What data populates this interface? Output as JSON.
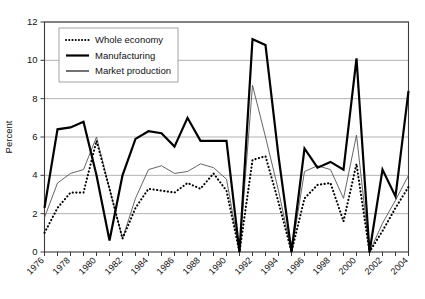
{
  "chart_data": {
    "type": "line",
    "title": "",
    "xlabel": "",
    "ylabel": "Percent",
    "ylim": [
      0,
      12
    ],
    "ytick_labels": [
      "0",
      "2",
      "4",
      "6",
      "8",
      "10",
      "12"
    ],
    "yticks": [
      0,
      2,
      4,
      6,
      8,
      10,
      12
    ],
    "grid": "horizontal",
    "legend_position": "top-left",
    "x": [
      1976,
      1977,
      1978,
      1979,
      1980,
      1981,
      1982,
      1983,
      1984,
      1985,
      1986,
      1987,
      1988,
      1989,
      1990,
      1991,
      1992,
      1993,
      1994,
      1995,
      1996,
      1997,
      1998,
      1999,
      2000,
      2001,
      2002,
      2003,
      2004
    ],
    "xtick_labels": [
      "1976",
      "1978",
      "1980",
      "1982",
      "1984",
      "1986",
      "1988",
      "1990",
      "1992",
      "1994",
      "1996",
      "1998",
      "2000",
      "2002",
      "2004"
    ],
    "xticks": [
      1976,
      1978,
      1980,
      1982,
      1984,
      1986,
      1988,
      1990,
      1992,
      1994,
      1996,
      1998,
      2000,
      2002,
      2004
    ],
    "series": [
      {
        "name": "Whole economy",
        "style": "dotted",
        "color": "#000000",
        "values": [
          1.0,
          2.3,
          3.1,
          3.1,
          5.8,
          3.3,
          0.7,
          2.3,
          3.3,
          3.2,
          3.1,
          3.6,
          3.3,
          4.1,
          3.2,
          0.0,
          4.8,
          5.0,
          2.6,
          0.0,
          2.8,
          3.5,
          3.6,
          1.6,
          4.6,
          0.0,
          1.1,
          2.3,
          3.4
        ]
      },
      {
        "name": "Manufacturing",
        "style": "solid-thick",
        "color": "#000000",
        "values": [
          2.3,
          6.4,
          6.5,
          6.8,
          4.0,
          0.6,
          4.0,
          5.9,
          6.3,
          6.2,
          5.5,
          7.0,
          5.8,
          5.8,
          5.8,
          0.0,
          11.1,
          10.8,
          5.0,
          0.0,
          5.4,
          4.4,
          4.7,
          4.3,
          10.1,
          0.0,
          4.3,
          2.9,
          8.4
        ]
      },
      {
        "name": "Market production",
        "style": "solid-thin",
        "color": "#555555",
        "values": [
          1.8,
          3.6,
          4.1,
          4.3,
          6.0,
          3.3,
          0.7,
          2.8,
          4.3,
          4.5,
          4.1,
          4.2,
          4.6,
          4.4,
          3.8,
          0.0,
          8.7,
          6.0,
          3.2,
          0.0,
          4.2,
          4.5,
          4.3,
          2.8,
          6.1,
          0.0,
          1.5,
          2.7,
          4.0
        ]
      }
    ]
  },
  "legend": {
    "items": [
      {
        "label": "Whole economy"
      },
      {
        "label": "Manufacturing"
      },
      {
        "label": "Market production"
      }
    ]
  }
}
